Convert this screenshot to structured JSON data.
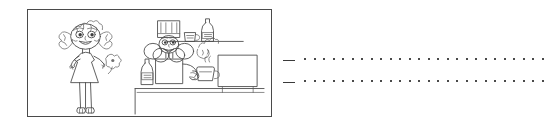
{
  "page": {
    "background_color": "#ffffff",
    "width": 546,
    "height": 124,
    "type": "worksheet-row"
  },
  "illustration": {
    "name": "childrens-line-drawing",
    "alt_description": "Hand-drawn line sketch: a girl with pigtails and a triangular dress stands at left holding a flower; at right a chef wearing a tall hat stands behind a counter holding a cup, with a bottle on the counter, a shelf above holding a bottle and a mug, and a large rectangular appliance at right.",
    "border_color": "#4a4a4a",
    "stroke_color": "#4d4d4d",
    "frame": {
      "x": 27,
      "y": 9,
      "width": 245,
      "height": 108
    },
    "elements": [
      {
        "name": "girl-figure",
        "label": "girl with pigtails in a dress"
      },
      {
        "name": "flower",
        "label": "flower held by girl"
      },
      {
        "name": "chef-figure",
        "label": "chef wearing tall hat"
      },
      {
        "name": "chef-hat",
        "label": "tall chef hat"
      },
      {
        "name": "counter",
        "label": "counter top"
      },
      {
        "name": "counter-bottle",
        "label": "bottle on counter"
      },
      {
        "name": "cup",
        "label": "cup held by chef"
      },
      {
        "name": "wall-shelf",
        "label": "wall shelf"
      },
      {
        "name": "shelf-bottle",
        "label": "bottle on shelf"
      },
      {
        "name": "shelf-mug",
        "label": "mug on shelf"
      },
      {
        "name": "appliance",
        "label": "rectangular appliance"
      }
    ]
  },
  "writing_area": {
    "name": "dotted-writing-lines",
    "line_color": "#4a4a4a",
    "dash_color": "#3a3a3a",
    "dot_count_per_line": 26,
    "dot_spacing_px": 9.5,
    "lines": [
      {
        "id": "line-1",
        "dash": true,
        "dots": true,
        "text": ""
      },
      {
        "id": "line-2",
        "dash": true,
        "dots": true,
        "text": ""
      }
    ]
  }
}
